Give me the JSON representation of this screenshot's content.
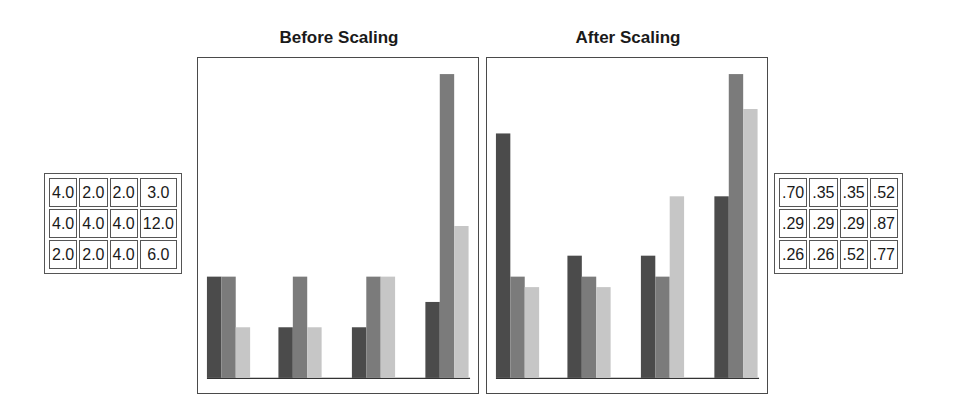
{
  "left_matrix": {
    "rows": [
      [
        "4.0",
        "2.0",
        "2.0",
        "3.0"
      ],
      [
        "4.0",
        "4.0",
        "4.0",
        "12.0"
      ],
      [
        "2.0",
        "2.0",
        "4.0",
        "6.0"
      ]
    ]
  },
  "right_matrix": {
    "rows": [
      [
        ".70",
        ".35",
        ".35",
        ".52"
      ],
      [
        ".29",
        ".29",
        ".29",
        ".87"
      ],
      [
        ".26",
        ".26",
        ".52",
        ".77"
      ]
    ]
  },
  "colors": {
    "series_1": "#4b4b4b",
    "series_2": "#7b7b7b",
    "series_3": "#c6c6c6",
    "axis": "#333333",
    "border": "#4a4a4a"
  },
  "chart_data": [
    {
      "type": "bar",
      "title": "Before Scaling",
      "categories": [
        "Column 1",
        "Column 2",
        "Column 3",
        "Column 4"
      ],
      "series": [
        {
          "name": "Row 1",
          "values": [
            4.0,
            2.0,
            2.0,
            3.0
          ]
        },
        {
          "name": "Row 2",
          "values": [
            4.0,
            4.0,
            4.0,
            12.0
          ]
        },
        {
          "name": "Row 3",
          "values": [
            2.0,
            2.0,
            4.0,
            6.0
          ]
        }
      ],
      "xlabel": "",
      "ylabel": "",
      "ylim": [
        0,
        12
      ],
      "grid": false,
      "legend": "none"
    },
    {
      "type": "bar",
      "title": "After Scaling",
      "categories": [
        "Column 1",
        "Column 2",
        "Column 3",
        "Column 4"
      ],
      "series": [
        {
          "name": "Row 1",
          "values": [
            0.7,
            0.35,
            0.35,
            0.52
          ]
        },
        {
          "name": "Row 2",
          "values": [
            0.29,
            0.29,
            0.29,
            0.87
          ]
        },
        {
          "name": "Row 3",
          "values": [
            0.26,
            0.26,
            0.52,
            0.77
          ]
        }
      ],
      "xlabel": "",
      "ylabel": "",
      "ylim": [
        0,
        0.87
      ],
      "grid": false,
      "legend": "none"
    }
  ]
}
